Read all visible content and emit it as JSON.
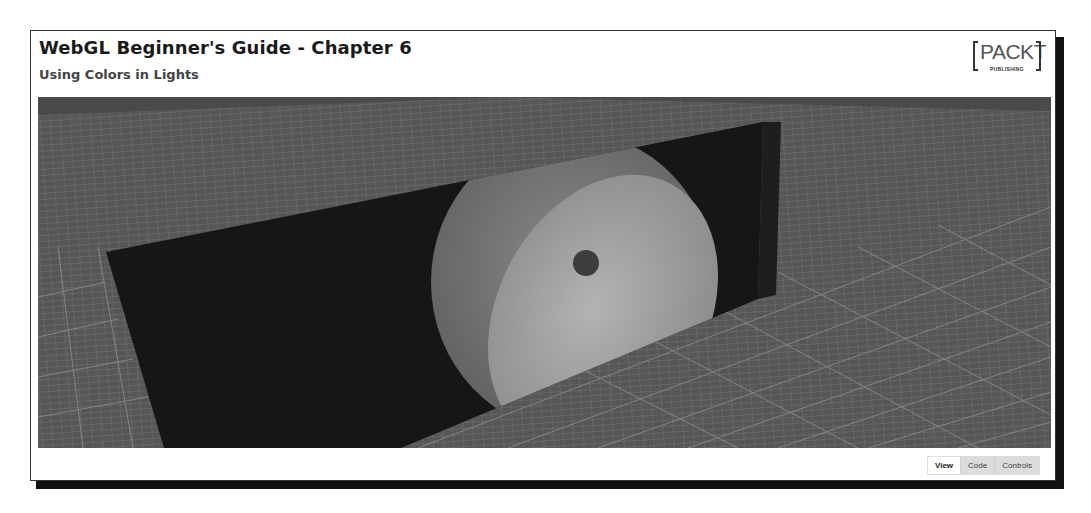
{
  "header": {
    "title": "WebGL Beginner's Guide - Chapter 6",
    "subtitle": "Using Colors in Lights"
  },
  "logo": {
    "word": "PACKT",
    "tagline": "PUBLISHING"
  },
  "canvas": {
    "scene": "3D floor grid with dark wall lit by colored spotlights",
    "floor_color": "#595959",
    "grid_line_color": "#9a9a9a",
    "wall_color": "#161616",
    "light_colors": [
      "#6e6e6e",
      "#9a9a9a"
    ]
  },
  "tabs": [
    {
      "label": "View",
      "active": true
    },
    {
      "label": "Code",
      "active": false
    },
    {
      "label": "Controls",
      "active": false
    }
  ]
}
